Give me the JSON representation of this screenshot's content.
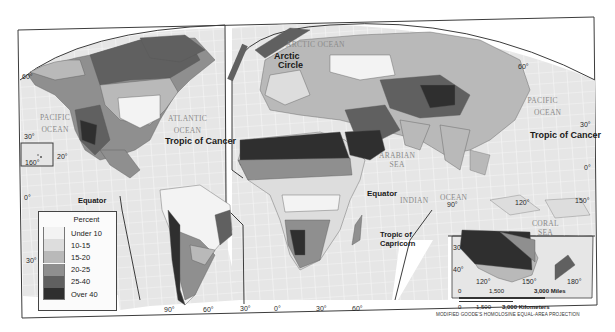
{
  "map": {
    "projection_label": "MODIFIED GOODE'S HOMOLOSINE EQUAL-AREA PROJECTION",
    "colors": {
      "frame": "#3c3c3c",
      "ocean": "#e8e8e8",
      "grid": "#f7f7f7",
      "land_base": "#d6d6d6"
    },
    "legend": {
      "title": "Percent",
      "items": [
        {
          "label": "Under 10",
          "color": "#f3f3f3"
        },
        {
          "label": "10-15",
          "color": "#dddddd"
        },
        {
          "label": "15-20",
          "color": "#b9b9b9"
        },
        {
          "label": "20-25",
          "color": "#8f8f8f"
        },
        {
          "label": "25-40",
          "color": "#606060"
        },
        {
          "label": "Over 40",
          "color": "#2f2f2f"
        }
      ]
    },
    "line_labels": {
      "arctic_circle_1": "Arctic",
      "arctic_circle_2": "Circle",
      "tropic_cancer_west": "Tropic of Cancer",
      "tropic_cancer_east": "Tropic of Cancer",
      "equator_west": "Equator",
      "equator_east": "Equator",
      "tropic_capricorn_1": "Tropic of",
      "tropic_capricorn_2": "Capricorn"
    },
    "water_labels": {
      "arctic_ocean": "ARCTIC OCEAN",
      "pacific_west_1": "PACIFIC",
      "pacific_west_2": "OCEAN",
      "atlantic_1": "ATLANTIC",
      "atlantic_2": "OCEAN",
      "pacific_east_1": "PACIFIC",
      "pacific_east_2": "OCEAN",
      "arabian_1": "ARABIAN",
      "arabian_2": "SEA",
      "indian_1": "INDIAN",
      "indian_2": "OCEAN",
      "coral_1": "CORAL",
      "coral_2": "SEA"
    },
    "degree_labels": {
      "lat_60_west": "60°",
      "lat_30_west": "30°",
      "hawaii_20": "20°",
      "hawaii_160": "160°",
      "lat_0_west": "0°",
      "lat_30s_west": "30°",
      "lon_90_sa": "90°",
      "lon_60_sa": "60°",
      "lon_30_sa": "30°",
      "lon_0_af": "0°",
      "lon_30_af": "30°",
      "lon_60_af": "60°",
      "lat_60_east": "60°",
      "lat_30_east": "30°",
      "lat_0_east": "0°",
      "lon_90_as": "90°",
      "lon_120_as": "120°",
      "lon_150_as": "150°",
      "aus_30": "30°",
      "aus_40": "40°",
      "aus_120": "120°",
      "aus_150": "150°",
      "aus_180": "180°"
    },
    "scale": {
      "miles_0": "0",
      "miles_1500": "1,500",
      "miles_3000": "3,000 Miles",
      "km_0": "0",
      "km_1500": "1,500",
      "km_3000": "3,000 Kilometers"
    }
  }
}
